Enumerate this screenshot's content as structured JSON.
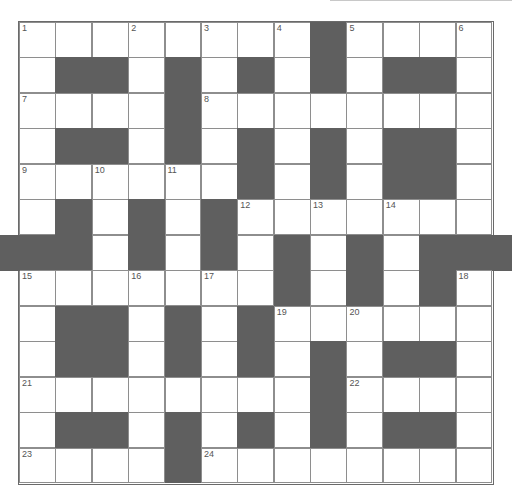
{
  "puzzle": {
    "rows": 13,
    "cols": 13,
    "colors": {
      "block": "#5f5f5f",
      "cell": "#ffffff",
      "border": "#8e8e8e"
    },
    "grid": [
      "........#....",
      ".##.#.#.#.##.",
      "....#........",
      ".##.#.#.#.##.",
      "......#.#.##.",
      ".#.#.#.......",
      "##.#.#.#.#.##",
      ".......#.#.#.",
      ".##.#.#......",
      ".##.#.#.#.##.",
      "........#....",
      ".##.#.#.#.##.",
      "....#........"
    ],
    "numbers": [
      {
        "n": "1",
        "r": 0,
        "c": 0
      },
      {
        "n": "2",
        "r": 0,
        "c": 3
      },
      {
        "n": "3",
        "r": 0,
        "c": 5
      },
      {
        "n": "4",
        "r": 0,
        "c": 7
      },
      {
        "n": "5",
        "r": 0,
        "c": 9
      },
      {
        "n": "6",
        "r": 0,
        "c": 12
      },
      {
        "n": "7",
        "r": 2,
        "c": 0
      },
      {
        "n": "8",
        "r": 2,
        "c": 5
      },
      {
        "n": "9",
        "r": 4,
        "c": 0
      },
      {
        "n": "10",
        "r": 4,
        "c": 2
      },
      {
        "n": "11",
        "r": 4,
        "c": 4
      },
      {
        "n": "12",
        "r": 5,
        "c": 6
      },
      {
        "n": "13",
        "r": 5,
        "c": 8
      },
      {
        "n": "14",
        "r": 5,
        "c": 10
      },
      {
        "n": "15",
        "r": 7,
        "c": 0
      },
      {
        "n": "16",
        "r": 7,
        "c": 3
      },
      {
        "n": "17",
        "r": 7,
        "c": 5
      },
      {
        "n": "18",
        "r": 7,
        "c": 12
      },
      {
        "n": "19",
        "r": 8,
        "c": 7
      },
      {
        "n": "20",
        "r": 8,
        "c": 9
      },
      {
        "n": "21",
        "r": 10,
        "c": 0
      },
      {
        "n": "22",
        "r": 10,
        "c": 9
      },
      {
        "n": "23",
        "r": 12,
        "c": 0
      },
      {
        "n": "24",
        "r": 12,
        "c": 5
      }
    ]
  }
}
